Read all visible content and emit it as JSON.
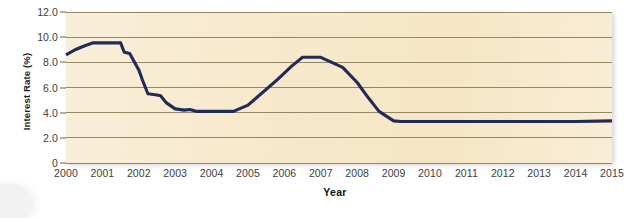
{
  "chart_data": {
    "type": "line",
    "title": "",
    "xlabel": "Year",
    "ylabel": "Interest Rate (%)",
    "xlim": [
      2000,
      2015
    ],
    "ylim": [
      0,
      12
    ],
    "grid": true,
    "legend": "none",
    "series_name": "Interest Rate",
    "series_color": "#202b57",
    "plot_background": "#f7e9cd",
    "gridline_color": "#8a7c58",
    "x_tick_labels": [
      "2000",
      "2001",
      "2002",
      "2003",
      "2004",
      "2005",
      "2006",
      "2007",
      "2008",
      "2009",
      "2010",
      "2011",
      "2012",
      "2013",
      "2014",
      "2015"
    ],
    "y_tick_labels": [
      "0",
      "2.0",
      "4.0",
      "6.0",
      "8.0",
      "10.0",
      "12.0"
    ],
    "y_tick_values": [
      0,
      2,
      4,
      6,
      8,
      10,
      12
    ],
    "x": [
      2000.0,
      2000.25,
      2000.5,
      2000.75,
      2001.0,
      2001.25,
      2001.5,
      2001.6,
      2001.75,
      2002.0,
      2002.1,
      2002.25,
      2002.5,
      2002.6,
      2002.75,
      2003.0,
      2003.25,
      2003.4,
      2003.6,
      2004.0,
      2004.3,
      2004.6,
      2005.0,
      2005.4,
      2005.8,
      2006.2,
      2006.5,
      2006.75,
      2007.0,
      2007.3,
      2007.6,
      2008.0,
      2008.3,
      2008.6,
      2009.0,
      2009.2,
      2010.0,
      2011.0,
      2012.0,
      2013.0,
      2014.0,
      2015.0
    ],
    "y": [
      8.6,
      9.0,
      9.3,
      9.55,
      9.55,
      9.55,
      9.55,
      8.8,
      8.7,
      7.4,
      6.6,
      5.5,
      5.4,
      5.35,
      4.8,
      4.3,
      4.2,
      4.25,
      4.1,
      4.1,
      4.1,
      4.1,
      4.6,
      5.6,
      6.6,
      7.7,
      8.4,
      8.4,
      8.4,
      8.0,
      7.6,
      6.4,
      5.2,
      4.1,
      3.35,
      3.3,
      3.3,
      3.3,
      3.3,
      3.3,
      3.3,
      3.35
    ],
    "annotations": []
  },
  "axes": {
    "y_title": "Interest Rate (%)",
    "x_title": "Year"
  },
  "ghost_text": {
    "top": "",
    "mid": "",
    "low": ""
  }
}
